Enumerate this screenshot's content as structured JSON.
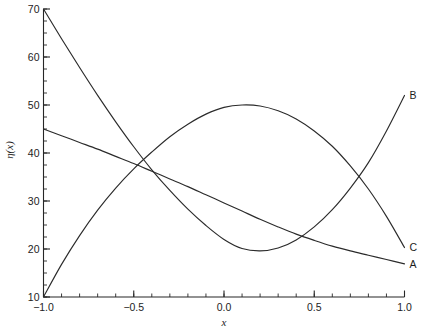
{
  "figure": {
    "background_color": "#ffffff",
    "ink_color": "#2b2b2b"
  },
  "chart_data": {
    "type": "line",
    "title": "",
    "subtitle": "",
    "xlabel": "x",
    "ylabel": "η(x)",
    "xlim": [
      -1.0,
      1.0
    ],
    "ylim": [
      10,
      70
    ],
    "grid": false,
    "legend_position": "right-end-labels",
    "x_ticks_major": [
      -1.0,
      -0.5,
      0.0,
      0.5,
      1.0
    ],
    "x_tick_labels": [
      "-1.0",
      "-0.5",
      "0.0",
      "0.5",
      "1.0"
    ],
    "x_minor_step": 0.1,
    "y_ticks_major": [
      10,
      20,
      30,
      40,
      50,
      60,
      70
    ],
    "y_tick_labels": [
      "10",
      "20",
      "30",
      "40",
      "50",
      "60",
      "70"
    ],
    "y_minor_step": 2.5,
    "annotations": [
      {
        "text": "B",
        "x": 1.0,
        "y": 52.0
      },
      {
        "text": "C",
        "x": 1.0,
        "y": 20.3
      },
      {
        "text": "A",
        "x": 1.0,
        "y": 16.9
      }
    ],
    "series": [
      {
        "name": "A",
        "label": "A",
        "color": "#2b2b2b",
        "x": [
          -1.0,
          -0.9,
          -0.8,
          -0.7,
          -0.6,
          -0.5,
          -0.4,
          -0.3,
          -0.2,
          -0.1,
          0.0,
          0.1,
          0.2,
          0.3,
          0.4,
          0.5,
          0.6,
          0.7,
          0.8,
          0.9,
          1.0
        ],
        "y": [
          45.0,
          43.6,
          42.2,
          40.8,
          39.3,
          37.8,
          36.2,
          34.6,
          33.0,
          31.3,
          29.6,
          27.9,
          26.2,
          24.6,
          23.1,
          21.8,
          20.6,
          19.6,
          18.7,
          17.8,
          16.9
        ]
      },
      {
        "name": "B",
        "label": "B",
        "color": "#2b2b2b",
        "x": [
          -1.0,
          -0.9,
          -0.8,
          -0.7,
          -0.6,
          -0.5,
          -0.4,
          -0.3,
          -0.2,
          -0.1,
          0.0,
          0.1,
          0.2,
          0.3,
          0.4,
          0.5,
          0.6,
          0.7,
          0.8,
          0.9,
          1.0
        ],
        "y": [
          70.0,
          63.8,
          57.8,
          52.0,
          46.5,
          41.3,
          36.5,
          32.2,
          28.3,
          24.9,
          22.0,
          20.1,
          19.6,
          20.2,
          21.9,
          24.6,
          28.2,
          32.7,
          38.0,
          44.6,
          52.0
        ]
      },
      {
        "name": "C",
        "label": "C",
        "color": "#2b2b2b",
        "x": [
          -1.0,
          -0.9,
          -0.8,
          -0.7,
          -0.6,
          -0.5,
          -0.4,
          -0.3,
          -0.2,
          -0.1,
          0.0,
          0.1,
          0.2,
          0.3,
          0.4,
          0.5,
          0.6,
          0.7,
          0.8,
          0.9,
          1.0
        ],
        "y": [
          10.0,
          16.8,
          22.8,
          28.1,
          32.7,
          36.7,
          40.2,
          43.4,
          46.0,
          48.1,
          49.5,
          50.0,
          49.8,
          48.8,
          47.1,
          44.6,
          41.4,
          37.3,
          32.5,
          26.8,
          20.3
        ]
      }
    ]
  }
}
